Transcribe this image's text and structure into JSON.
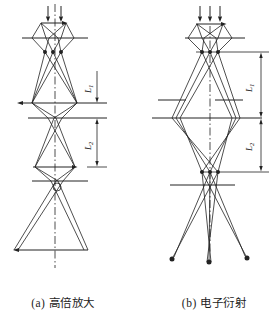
{
  "colors": {
    "line": "#222222",
    "background": "#ffffff"
  },
  "panels": {
    "a": {
      "caption": "(a) 高倍放大",
      "labels": {
        "l1": {
          "main": "L",
          "sub": "1"
        },
        "l2": {
          "main": "L",
          "sub": "2"
        }
      }
    },
    "b": {
      "caption": "(b) 电子衍射",
      "labels": {
        "l1": {
          "main": "L",
          "sub": "1"
        },
        "l2": {
          "main": "L",
          "sub": "2"
        }
      }
    }
  }
}
